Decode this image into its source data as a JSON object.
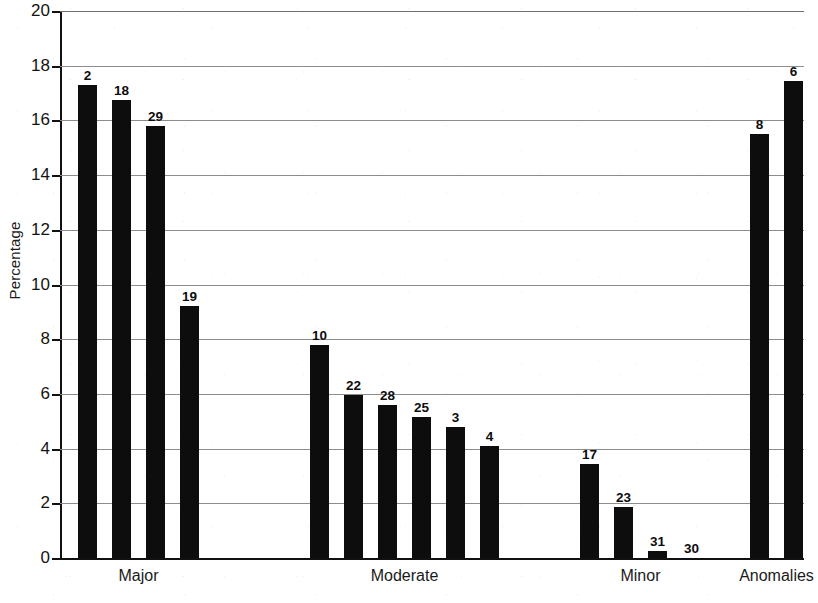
{
  "chart_data": {
    "type": "bar",
    "title": "",
    "xlabel": "",
    "ylabel": "Percentage",
    "ylim": [
      0,
      20
    ],
    "y_ticks": [
      0,
      2,
      4,
      6,
      8,
      10,
      12,
      14,
      16,
      18,
      20
    ],
    "y_tick_labels": [
      "0",
      "2",
      "4",
      "6",
      "8",
      "10",
      "12",
      "14",
      "16",
      "18",
      "20"
    ],
    "grid": true,
    "grid_axis": "y",
    "legend": false,
    "legend_position": "none",
    "bar_color": "#0d0d0d",
    "categories": [
      "Major",
      "Moderate",
      "Minor",
      "Anomalies"
    ],
    "groups": [
      {
        "category": "Major",
        "bars": [
          {
            "label": "2",
            "value": 17.3
          },
          {
            "label": "18",
            "value": 16.75
          },
          {
            "label": "29",
            "value": 15.8
          },
          {
            "label": "19",
            "value": 9.2
          }
        ]
      },
      {
        "category": "Moderate",
        "bars": [
          {
            "label": "10",
            "value": 7.8
          },
          {
            "label": "22",
            "value": 5.95
          },
          {
            "label": "28",
            "value": 5.6
          },
          {
            "label": "25",
            "value": 5.15
          },
          {
            "label": "3",
            "value": 4.8
          },
          {
            "label": "4",
            "value": 4.1
          }
        ]
      },
      {
        "category": "Minor",
        "bars": [
          {
            "label": "17",
            "value": 3.45
          },
          {
            "label": "23",
            "value": 1.85
          },
          {
            "label": "31",
            "value": 0.25
          },
          {
            "label": "30",
            "value": 0.0
          }
        ]
      },
      {
        "category": "Anomalies",
        "bars": [
          {
            "label": "8",
            "value": 15.5
          },
          {
            "label": "6",
            "value": 17.45
          }
        ]
      }
    ],
    "bar_labels_flat": [
      "2",
      "18",
      "29",
      "19",
      "10",
      "22",
      "28",
      "25",
      "3",
      "4",
      "17",
      "23",
      "31",
      "30",
      "8",
      "6"
    ],
    "values_flat": [
      17.3,
      16.75,
      15.8,
      9.2,
      7.8,
      5.95,
      5.6,
      5.15,
      4.8,
      4.1,
      3.45,
      1.85,
      0.25,
      0.0,
      15.5,
      17.45
    ]
  },
  "layout": {
    "bar_width_px": 19,
    "bar_positions_px": [
      18,
      52,
      86,
      120,
      250,
      284,
      318,
      352,
      386,
      420,
      520,
      554,
      588,
      622,
      690,
      724
    ]
  }
}
